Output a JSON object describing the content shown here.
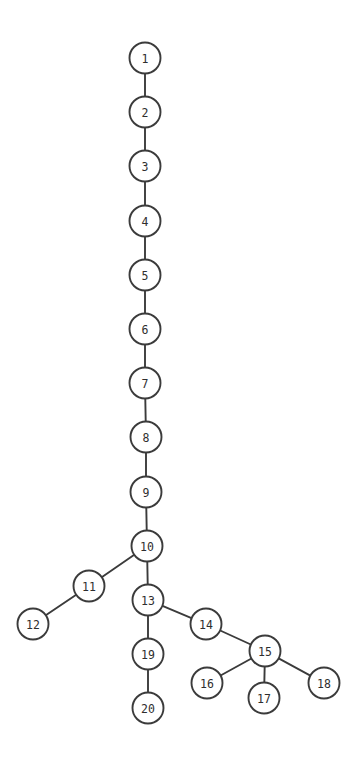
{
  "diagram": {
    "title": "",
    "type": "tree-graph",
    "background_color": "#ffffff",
    "node_fill_color": "#ffffff",
    "node_stroke_color": "#3b3b3b",
    "edge_color": "#3b3b3b",
    "label_color": "#2e2e2e",
    "node_radius": 15.5,
    "width": 357,
    "height": 758,
    "nodes": [
      {
        "id": "1",
        "label": "1",
        "x": 145,
        "y": 58
      },
      {
        "id": "2",
        "label": "2",
        "x": 145,
        "y": 112
      },
      {
        "id": "3",
        "label": "3",
        "x": 145,
        "y": 166
      },
      {
        "id": "4",
        "label": "4",
        "x": 145,
        "y": 221
      },
      {
        "id": "5",
        "label": "5",
        "x": 145,
        "y": 275
      },
      {
        "id": "6",
        "label": "6",
        "x": 145,
        "y": 329
      },
      {
        "id": "7",
        "label": "7",
        "x": 145,
        "y": 383
      },
      {
        "id": "8",
        "label": "8",
        "x": 146,
        "y": 437
      },
      {
        "id": "9",
        "label": "9",
        "x": 146,
        "y": 492
      },
      {
        "id": "10",
        "label": "10",
        "x": 147,
        "y": 546
      },
      {
        "id": "11",
        "label": "11",
        "x": 89,
        "y": 586
      },
      {
        "id": "12",
        "label": "12",
        "x": 33,
        "y": 624
      },
      {
        "id": "13",
        "label": "13",
        "x": 148,
        "y": 600
      },
      {
        "id": "14",
        "label": "14",
        "x": 206,
        "y": 624
      },
      {
        "id": "15",
        "label": "15",
        "x": 265,
        "y": 651
      },
      {
        "id": "16",
        "label": "16",
        "x": 207,
        "y": 683
      },
      {
        "id": "17",
        "label": "17",
        "x": 264,
        "y": 698
      },
      {
        "id": "18",
        "label": "18",
        "x": 324,
        "y": 683
      },
      {
        "id": "19",
        "label": "19",
        "x": 148,
        "y": 654
      },
      {
        "id": "20",
        "label": "20",
        "x": 148,
        "y": 708
      }
    ],
    "edges": [
      {
        "source": "1",
        "target": "2"
      },
      {
        "source": "2",
        "target": "3"
      },
      {
        "source": "3",
        "target": "4"
      },
      {
        "source": "4",
        "target": "5"
      },
      {
        "source": "5",
        "target": "6"
      },
      {
        "source": "6",
        "target": "7"
      },
      {
        "source": "7",
        "target": "8"
      },
      {
        "source": "8",
        "target": "9"
      },
      {
        "source": "9",
        "target": "10"
      },
      {
        "source": "10",
        "target": "11"
      },
      {
        "source": "11",
        "target": "12"
      },
      {
        "source": "10",
        "target": "13"
      },
      {
        "source": "13",
        "target": "14"
      },
      {
        "source": "13",
        "target": "19"
      },
      {
        "source": "14",
        "target": "15"
      },
      {
        "source": "15",
        "target": "16"
      },
      {
        "source": "15",
        "target": "17"
      },
      {
        "source": "15",
        "target": "18"
      },
      {
        "source": "19",
        "target": "20"
      }
    ]
  }
}
